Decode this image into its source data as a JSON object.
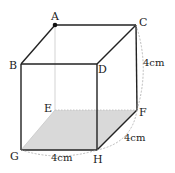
{
  "diagram": {
    "type": "cube",
    "vertices": {
      "A": "A",
      "B": "B",
      "C": "C",
      "D": "D",
      "E": "E",
      "F": "F",
      "G": "G",
      "H": "H"
    },
    "dimensions": {
      "CF": "4cm",
      "FH": "4cm",
      "GH": "4cm"
    },
    "shaded_face": "EFHG",
    "marked_point": "A",
    "colors": {
      "edge": "#222222",
      "hidden_edge": "#bbbbbb",
      "shade": "#d9d9d9",
      "dim_arc": "#aaaaaa"
    }
  }
}
